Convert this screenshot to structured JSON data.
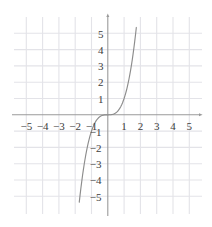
{
  "chart_data": {
    "type": "line",
    "title": "",
    "subtitle": "",
    "xlabel": "",
    "ylabel": "",
    "xlim": [
      -5.75,
      5.75
    ],
    "ylim": [
      -5.75,
      5.75
    ],
    "grid": true,
    "legend": null,
    "x_ticks": [
      -5,
      -4,
      -3,
      -2,
      -1,
      1,
      2,
      3,
      4,
      5
    ],
    "y_ticks": [
      5,
      4,
      3,
      2,
      1,
      -1,
      -2,
      -3,
      -4,
      -5
    ],
    "x_tick_labels": [
      "−5",
      "−4",
      "−3",
      "−2",
      "−1",
      "1",
      "2",
      "3",
      "4",
      "5"
    ],
    "y_tick_labels": [
      "5",
      "4",
      "3",
      "2",
      "1",
      "−1",
      "−2",
      "−3",
      "−4",
      "−5"
    ],
    "series": [
      {
        "name": "y = x³",
        "equation": "y = x^3",
        "color": "#8c8c8c",
        "x": [
          -1.75,
          -1.7,
          -1.65,
          -1.6,
          -1.55,
          -1.5,
          -1.45,
          -1.4,
          -1.35,
          -1.3,
          -1.25,
          -1.2,
          -1.15,
          -1.1,
          -1.05,
          -1.0,
          -0.95,
          -0.9,
          -0.85,
          -0.8,
          -0.75,
          -0.7,
          -0.65,
          -0.6,
          -0.55,
          -0.5,
          -0.45,
          -0.4,
          -0.35,
          -0.3,
          -0.25,
          -0.2,
          -0.15,
          -0.1,
          -0.05,
          0,
          0.05,
          0.1,
          0.15,
          0.2,
          0.25,
          0.3,
          0.35,
          0.4,
          0.45,
          0.5,
          0.55,
          0.6,
          0.65,
          0.7,
          0.75,
          0.8,
          0.85,
          0.9,
          0.95,
          1.0,
          1.05,
          1.1,
          1.15,
          1.2,
          1.25,
          1.3,
          1.35,
          1.4,
          1.45,
          1.5,
          1.55,
          1.6,
          1.65,
          1.7,
          1.75
        ],
        "y": [
          -5.359,
          -4.913,
          -4.492,
          -4.096,
          -3.724,
          -3.375,
          -3.048,
          -2.744,
          -2.46,
          -2.197,
          -1.953,
          -1.728,
          -1.521,
          -1.331,
          -1.158,
          -1.0,
          -0.857,
          -0.729,
          -0.614,
          -0.512,
          -0.422,
          -0.343,
          -0.275,
          -0.216,
          -0.166,
          -0.125,
          -0.091,
          -0.064,
          -0.043,
          -0.027,
          -0.016,
          -0.008,
          -0.003,
          -0.001,
          0.0,
          0,
          0.0,
          0.001,
          0.003,
          0.008,
          0.016,
          0.027,
          0.043,
          0.064,
          0.091,
          0.125,
          0.166,
          0.216,
          0.275,
          0.343,
          0.422,
          0.512,
          0.614,
          0.729,
          0.857,
          1.0,
          1.158,
          1.331,
          1.521,
          1.728,
          1.953,
          2.197,
          2.46,
          2.744,
          3.048,
          3.375,
          3.724,
          4.096,
          4.492,
          4.913,
          5.359
        ]
      }
    ],
    "colors": {
      "grid": "#e3e3e8",
      "axis": "#9a9a9a",
      "curve": "#8c8c8c",
      "tick_text": "#3c3c3c",
      "background": "#ffffff"
    },
    "axes": {
      "x_axis_arrow": true,
      "y_axis_arrow": true,
      "origin_label": ""
    }
  }
}
